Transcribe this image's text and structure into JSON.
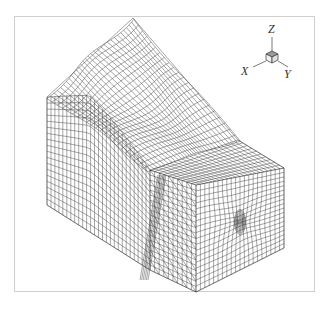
{
  "figure": {
    "frame_color": "#cfcfcf",
    "mesh_color": "#3a3a3a",
    "background": "#ffffff"
  },
  "triad": {
    "labels": {
      "x": "X",
      "y": "Y",
      "z": "Z"
    }
  },
  "geometry": {
    "peak": [
      133,
      18
    ],
    "left_top": [
      47,
      97
    ],
    "left_bottom": [
      47,
      205
    ],
    "front_top": [
      196,
      185
    ],
    "front_bottom": [
      196,
      292
    ],
    "right_top": [
      284,
      168
    ],
    "right_bottom": [
      284,
      248
    ],
    "dense_spot": [
      240,
      222
    ]
  }
}
